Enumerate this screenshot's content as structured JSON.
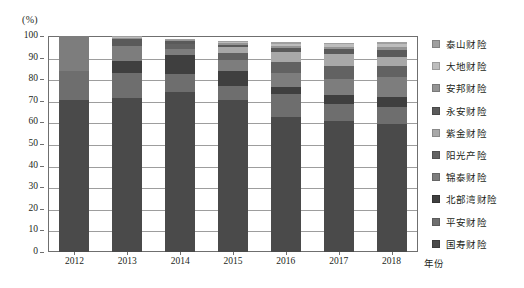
{
  "chart_data": {
    "type": "bar",
    "subtype": "stacked-100-percent",
    "title": "",
    "xlabel": "年份",
    "ylabel": "",
    "unit_label": "(%)",
    "ylim": [
      0,
      100
    ],
    "yticks": [
      0,
      10,
      20,
      30,
      40,
      50,
      60,
      70,
      80,
      90,
      100
    ],
    "grid": true,
    "legend_position": "right",
    "categories": [
      "2012",
      "2013",
      "2014",
      "2015",
      "2016",
      "2017",
      "2018"
    ],
    "series": [
      {
        "name": "国寿财险",
        "color": "#4a4a4a",
        "values": [
          70.5,
          71.3,
          74.2,
          70.2,
          62.6,
          60.6,
          59.4
        ]
      },
      {
        "name": "平安财险",
        "color": "#6e6e6e",
        "values": [
          13.2,
          11.7,
          8.4,
          6.6,
          10.4,
          7.9,
          7.5
        ]
      },
      {
        "name": "北部湾财险",
        "color": "#3f3f3f",
        "values": [
          0.0,
          5.4,
          8.6,
          6.8,
          3.5,
          4.3,
          4.9
        ]
      },
      {
        "name": "锦泰财险",
        "color": "#7d7d7d",
        "values": [
          16.3,
          6.8,
          2.9,
          5.2,
          6.4,
          7.2,
          9.1
        ]
      },
      {
        "name": "阳光产险",
        "color": "#626262",
        "values": [
          0.0,
          0.0,
          2.1,
          3.3,
          5.2,
          6.1,
          5.4
        ]
      },
      {
        "name": "紫金财险",
        "color": "#a8a8a8",
        "values": [
          0.0,
          0.0,
          0.0,
          2.6,
          4.3,
          5.4,
          4.2
        ]
      },
      {
        "name": "永安财险",
        "color": "#5a5a5a",
        "values": [
          0.0,
          3.3,
          1.4,
          1.2,
          2.0,
          2.3,
          3.0
        ]
      },
      {
        "name": "安邦财险",
        "color": "#949494",
        "values": [
          0.0,
          0.8,
          0.5,
          0.8,
          1.1,
          1.3,
          1.5
        ]
      },
      {
        "name": "大地财险",
        "color": "#bdbdbd",
        "values": [
          0.0,
          0.5,
          0.4,
          0.5,
          0.9,
          1.0,
          1.2
        ]
      },
      {
        "name": "泰山财险",
        "color": "#9f9f9f",
        "values": [
          0.0,
          0.3,
          0.3,
          0.4,
          0.6,
          0.8,
          0.9
        ]
      }
    ],
    "totals": [
      100.0,
      100.1,
      98.8,
      97.6,
      97.0,
      96.9,
      97.1
    ]
  },
  "legend": {
    "items": [
      {
        "label": "泰山财险",
        "swatch": "#9f9f9f"
      },
      {
        "label": "大地财险",
        "swatch": "#bdbdbd"
      },
      {
        "label": "安邦财险",
        "swatch": "#949494"
      },
      {
        "label": "永安财险",
        "swatch": "#5a5a5a"
      },
      {
        "label": "紫金财险",
        "swatch": "#a8a8a8"
      },
      {
        "label": "阳光产险",
        "swatch": "#626262"
      },
      {
        "label": "锦泰财险",
        "swatch": "#7d7d7d"
      },
      {
        "label": "北部湾财险",
        "swatch": "#3f3f3f"
      },
      {
        "label": "平安财险",
        "swatch": "#6e6e6e"
      },
      {
        "label": "国寿财险",
        "swatch": "#4a4a4a"
      }
    ]
  },
  "axes": {
    "y_unit": "(%)",
    "y_tick_labels": [
      "100",
      "90",
      "80",
      "70",
      "60",
      "50",
      "40",
      "30",
      "20",
      "10",
      "0"
    ],
    "x_tick_labels": [
      "2012",
      "2013",
      "2014",
      "2015",
      "2016",
      "2017",
      "2018"
    ],
    "x_title": "年份"
  },
  "style": {
    "axis_color": "#6f6f6f",
    "grid_color": "#9d9d9d",
    "text_color": "#231f20",
    "background": "#ffffff"
  }
}
